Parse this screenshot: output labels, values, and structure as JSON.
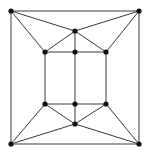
{
  "figure": {
    "width": 148,
    "height": 153,
    "background_color": "#ffffff",
    "edge_color": "#3a3a3a",
    "vertex_color": "#111111",
    "vertex_radius": 2.6,
    "edge_width": 1
  },
  "graph": {
    "vertex_count": 12,
    "edge_count": 24,
    "vertices": [
      {
        "id": "outer-top-left",
        "label": "v1",
        "x": 11,
        "y": 11
      },
      {
        "id": "outer-top-right",
        "label": "v2",
        "x": 139,
        "y": 11
      },
      {
        "id": "outer-bottom-right",
        "label": "v3",
        "x": 139,
        "y": 144
      },
      {
        "id": "outer-bottom-left",
        "label": "v4",
        "x": 11,
        "y": 144
      },
      {
        "id": "apex-top",
        "label": "v5",
        "x": 75,
        "y": 31
      },
      {
        "id": "apex-bottom",
        "label": "v6",
        "x": 75,
        "y": 124
      },
      {
        "id": "inner-top-left",
        "label": "v7",
        "x": 45,
        "y": 52
      },
      {
        "id": "inner-top-mid",
        "label": "v8",
        "x": 75,
        "y": 52
      },
      {
        "id": "inner-top-right",
        "label": "v9",
        "x": 106,
        "y": 52
      },
      {
        "id": "inner-bottom-left",
        "label": "v10",
        "x": 45,
        "y": 104
      },
      {
        "id": "inner-bottom-mid",
        "label": "v11",
        "x": 75,
        "y": 104
      },
      {
        "id": "inner-bottom-right",
        "label": "v12",
        "x": 106,
        "y": 104
      }
    ],
    "edges": [
      {
        "from": "outer-top-left",
        "to": "outer-top-right"
      },
      {
        "from": "outer-top-right",
        "to": "outer-bottom-right"
      },
      {
        "from": "outer-bottom-right",
        "to": "outer-bottom-left"
      },
      {
        "from": "outer-bottom-left",
        "to": "outer-top-left"
      },
      {
        "from": "inner-top-left",
        "to": "inner-top-mid"
      },
      {
        "from": "inner-top-mid",
        "to": "inner-top-right"
      },
      {
        "from": "inner-top-right",
        "to": "inner-bottom-right"
      },
      {
        "from": "inner-bottom-right",
        "to": "inner-bottom-mid"
      },
      {
        "from": "inner-bottom-mid",
        "to": "inner-bottom-left"
      },
      {
        "from": "inner-bottom-left",
        "to": "inner-top-left"
      },
      {
        "from": "inner-top-mid",
        "to": "inner-bottom-mid"
      },
      {
        "from": "outer-top-left",
        "to": "apex-top"
      },
      {
        "from": "outer-top-right",
        "to": "apex-top"
      },
      {
        "from": "outer-top-left",
        "to": "inner-top-left"
      },
      {
        "from": "outer-top-right",
        "to": "inner-top-right"
      },
      {
        "from": "apex-top",
        "to": "inner-top-left"
      },
      {
        "from": "apex-top",
        "to": "inner-top-mid"
      },
      {
        "from": "apex-top",
        "to": "inner-top-right"
      },
      {
        "from": "outer-bottom-left",
        "to": "apex-bottom"
      },
      {
        "from": "outer-bottom-right",
        "to": "apex-bottom"
      },
      {
        "from": "outer-bottom-left",
        "to": "inner-bottom-left"
      },
      {
        "from": "outer-bottom-right",
        "to": "inner-bottom-right"
      },
      {
        "from": "apex-bottom",
        "to": "inner-bottom-left"
      },
      {
        "from": "apex-bottom",
        "to": "inner-bottom-mid"
      },
      {
        "from": "apex-bottom",
        "to": "inner-bottom-right"
      }
    ]
  }
}
